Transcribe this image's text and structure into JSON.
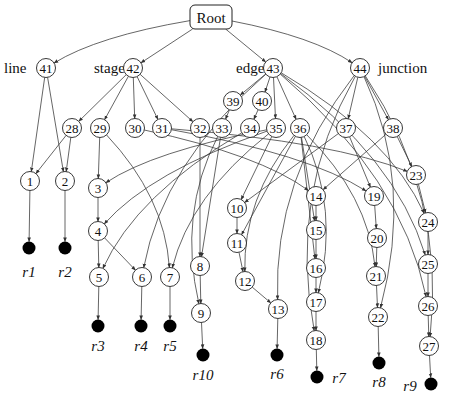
{
  "diagram": {
    "type": "directed-acyclic-graph",
    "root": {
      "id": "root",
      "label": "Root",
      "x": 211,
      "y": 17,
      "w": 42,
      "h": 24
    },
    "group_labels": [
      {
        "id": "line",
        "label": "line",
        "x": 4,
        "y": 68
      },
      {
        "id": "stage",
        "label": "stage",
        "x": 94,
        "y": 68
      },
      {
        "id": "edge",
        "label": "edge",
        "x": 236,
        "y": 68
      },
      {
        "id": "junction",
        "label": "junction",
        "x": 378,
        "y": 68
      }
    ],
    "nodes": [
      {
        "id": "41",
        "label": "41",
        "x": 46,
        "y": 68
      },
      {
        "id": "42",
        "label": "42",
        "x": 133,
        "y": 68
      },
      {
        "id": "43",
        "label": "43",
        "x": 273,
        "y": 68
      },
      {
        "id": "44",
        "label": "44",
        "x": 360,
        "y": 68
      },
      {
        "id": "39",
        "label": "39",
        "x": 233,
        "y": 101
      },
      {
        "id": "40",
        "label": "40",
        "x": 262,
        "y": 101
      },
      {
        "id": "28",
        "label": "28",
        "x": 72,
        "y": 128
      },
      {
        "id": "29",
        "label": "29",
        "x": 100,
        "y": 128
      },
      {
        "id": "30",
        "label": "30",
        "x": 135,
        "y": 128
      },
      {
        "id": "31",
        "label": "31",
        "x": 162,
        "y": 128
      },
      {
        "id": "32",
        "label": "32",
        "x": 200,
        "y": 128
      },
      {
        "id": "33",
        "label": "33",
        "x": 222,
        "y": 128
      },
      {
        "id": "34",
        "label": "34",
        "x": 250,
        "y": 128
      },
      {
        "id": "35",
        "label": "35",
        "x": 276,
        "y": 128
      },
      {
        "id": "36",
        "label": "36",
        "x": 300,
        "y": 128
      },
      {
        "id": "37",
        "label": "37",
        "x": 346,
        "y": 128
      },
      {
        "id": "38",
        "label": "38",
        "x": 393,
        "y": 128
      },
      {
        "id": "1",
        "label": "1",
        "x": 30,
        "y": 181
      },
      {
        "id": "2",
        "label": "2",
        "x": 65,
        "y": 181
      },
      {
        "id": "3",
        "label": "3",
        "x": 98,
        "y": 188
      },
      {
        "id": "4",
        "label": "4",
        "x": 98,
        "y": 231
      },
      {
        "id": "5",
        "label": "5",
        "x": 99,
        "y": 277
      },
      {
        "id": "6",
        "label": "6",
        "x": 142,
        "y": 277
      },
      {
        "id": "7",
        "label": "7",
        "x": 170,
        "y": 277
      },
      {
        "id": "8",
        "label": "8",
        "x": 200,
        "y": 266
      },
      {
        "id": "9",
        "label": "9",
        "x": 201,
        "y": 313
      },
      {
        "id": "10",
        "label": "10",
        "x": 237,
        "y": 208
      },
      {
        "id": "11",
        "label": "11",
        "x": 237,
        "y": 243
      },
      {
        "id": "12",
        "label": "12",
        "x": 245,
        "y": 281
      },
      {
        "id": "13",
        "label": "13",
        "x": 278,
        "y": 309
      },
      {
        "id": "14",
        "label": "14",
        "x": 316,
        "y": 196
      },
      {
        "id": "15",
        "label": "15",
        "x": 316,
        "y": 230
      },
      {
        "id": "16",
        "label": "16",
        "x": 316,
        "y": 268
      },
      {
        "id": "17",
        "label": "17",
        "x": 316,
        "y": 302
      },
      {
        "id": "18",
        "label": "18",
        "x": 316,
        "y": 340
      },
      {
        "id": "19",
        "label": "19",
        "x": 374,
        "y": 196
      },
      {
        "id": "20",
        "label": "20",
        "x": 377,
        "y": 238
      },
      {
        "id": "21",
        "label": "21",
        "x": 376,
        "y": 276
      },
      {
        "id": "22",
        "label": "22",
        "x": 378,
        "y": 317
      },
      {
        "id": "23",
        "label": "23",
        "x": 416,
        "y": 175
      },
      {
        "id": "24",
        "label": "24",
        "x": 428,
        "y": 222
      },
      {
        "id": "25",
        "label": "25",
        "x": 428,
        "y": 264
      },
      {
        "id": "26",
        "label": "26",
        "x": 428,
        "y": 306
      },
      {
        "id": "27",
        "label": "27",
        "x": 429,
        "y": 346
      }
    ],
    "sinks": [
      {
        "id": "r1",
        "label": "r1",
        "x": 29,
        "y": 248,
        "lx": 29,
        "ly": 277
      },
      {
        "id": "r2",
        "label": "r2",
        "x": 65,
        "y": 248,
        "lx": 65,
        "ly": 277
      },
      {
        "id": "r3",
        "label": "r3",
        "x": 98,
        "y": 326,
        "lx": 98,
        "ly": 351
      },
      {
        "id": "r4",
        "label": "r4",
        "x": 141,
        "y": 326,
        "lx": 141,
        "ly": 351
      },
      {
        "id": "r5",
        "label": "r5",
        "x": 170,
        "y": 326,
        "lx": 170,
        "ly": 351
      },
      {
        "id": "r10",
        "label": "r10",
        "x": 203,
        "y": 355,
        "lx": 203,
        "ly": 380
      },
      {
        "id": "r6",
        "label": "r6",
        "x": 277,
        "y": 355,
        "lx": 277,
        "ly": 379
      },
      {
        "id": "r7",
        "label": "r7",
        "x": 317,
        "y": 377,
        "lx": 339,
        "ly": 383
      },
      {
        "id": "r8",
        "label": "r8",
        "x": 379,
        "y": 363,
        "lx": 379,
        "ly": 387
      },
      {
        "id": "r9",
        "label": "r9",
        "x": 431,
        "y": 384,
        "lx": 410,
        "ly": 391
      }
    ],
    "edges": [
      [
        "root",
        "41"
      ],
      [
        "root",
        "42"
      ],
      [
        "root",
        "43"
      ],
      [
        "root",
        "44"
      ],
      [
        "41",
        "1"
      ],
      [
        "41",
        "2"
      ],
      [
        "42",
        "28"
      ],
      [
        "42",
        "29"
      ],
      [
        "42",
        "30"
      ],
      [
        "42",
        "31"
      ],
      [
        "42",
        "32"
      ],
      [
        "43",
        "39"
      ],
      [
        "43",
        "40"
      ],
      [
        "43",
        "35"
      ],
      [
        "43",
        "36"
      ],
      [
        "43",
        "6"
      ],
      [
        "43",
        "24"
      ],
      [
        "43",
        "25"
      ],
      [
        "43",
        "26"
      ],
      [
        "44",
        "37"
      ],
      [
        "44",
        "38"
      ],
      [
        "44",
        "18"
      ],
      [
        "44",
        "22"
      ],
      [
        "44",
        "27"
      ],
      [
        "44",
        "13"
      ],
      [
        "39",
        "33"
      ],
      [
        "40",
        "34"
      ],
      [
        "28",
        "1"
      ],
      [
        "28",
        "2"
      ],
      [
        "29",
        "3"
      ],
      [
        "29",
        "7"
      ],
      [
        "30",
        "14"
      ],
      [
        "31",
        "19"
      ],
      [
        "31",
        "23"
      ],
      [
        "32",
        "8"
      ],
      [
        "33",
        "8"
      ],
      [
        "33",
        "9"
      ],
      [
        "34",
        "5"
      ],
      [
        "35",
        "3"
      ],
      [
        "35",
        "4"
      ],
      [
        "35",
        "7"
      ],
      [
        "35",
        "10"
      ],
      [
        "36",
        "11"
      ],
      [
        "36",
        "12"
      ],
      [
        "36",
        "15"
      ],
      [
        "36",
        "16"
      ],
      [
        "36",
        "17"
      ],
      [
        "36",
        "21"
      ],
      [
        "37",
        "10"
      ],
      [
        "37",
        "19"
      ],
      [
        "38",
        "14"
      ],
      [
        "38",
        "23"
      ],
      [
        "1",
        "r1"
      ],
      [
        "2",
        "r2"
      ],
      [
        "3",
        "4"
      ],
      [
        "4",
        "5"
      ],
      [
        "4",
        "6"
      ],
      [
        "5",
        "r3"
      ],
      [
        "6",
        "r4"
      ],
      [
        "7",
        "r5"
      ],
      [
        "8",
        "9"
      ],
      [
        "9",
        "r10"
      ],
      [
        "10",
        "11"
      ],
      [
        "11",
        "12"
      ],
      [
        "12",
        "13"
      ],
      [
        "13",
        "r6"
      ],
      [
        "14",
        "15"
      ],
      [
        "15",
        "16"
      ],
      [
        "16",
        "17"
      ],
      [
        "17",
        "18"
      ],
      [
        "18",
        "r7"
      ],
      [
        "19",
        "20"
      ],
      [
        "20",
        "21"
      ],
      [
        "21",
        "22"
      ],
      [
        "22",
        "r8"
      ],
      [
        "23",
        "24"
      ],
      [
        "24",
        "25"
      ],
      [
        "25",
        "26"
      ],
      [
        "26",
        "27"
      ],
      [
        "27",
        "r9"
      ]
    ]
  }
}
